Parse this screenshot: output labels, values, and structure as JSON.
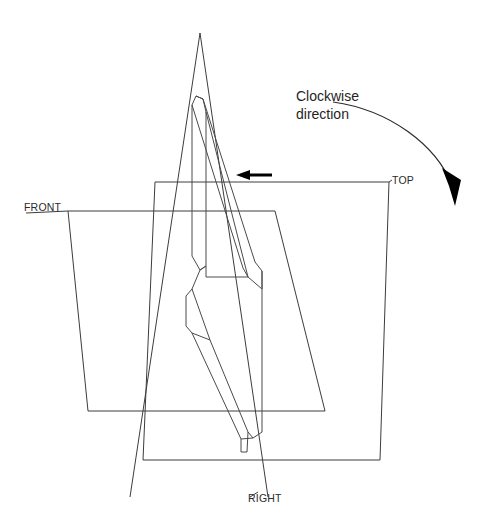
{
  "diagram": {
    "type": "orthographic-projection-planes",
    "background_color": "#ffffff",
    "line_color": "#3c3c3c",
    "accent_color": "#000000",
    "labels": {
      "top_plane": "TOP",
      "front_plane": "FRONT",
      "right_plane": "RIGHT"
    },
    "annotation": {
      "line1": "Clockwise",
      "line2": "direction"
    },
    "planes": [
      {
        "name": "TOP",
        "label": "TOP",
        "shape": "parallelogram",
        "points": "155,182 389,182 380,460 143,460"
      },
      {
        "name": "FRONT",
        "label": "FRONT",
        "shape": "parallelogram",
        "points": "68,211 275,211 325,411 88,411"
      },
      {
        "name": "RIGHT",
        "label": "RIGHT",
        "shape": "triangle",
        "points": "200,33 268,497 130,497"
      }
    ],
    "object": {
      "name": "angle-bracket",
      "description": "L-shaped bracket shown in isometric orientation"
    },
    "indicators": [
      {
        "name": "straight-arrow",
        "direction": "left",
        "x_start": 272,
        "x_end": 236,
        "y": 175
      },
      {
        "name": "rotation-arrow",
        "direction": "clockwise",
        "arc_start": "333,102",
        "arc_end": "455,205"
      }
    ]
  }
}
